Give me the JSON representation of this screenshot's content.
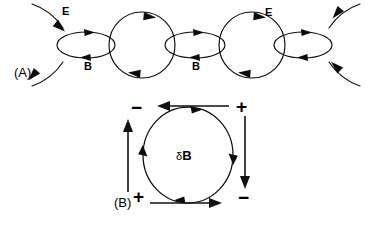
{
  "figure": {
    "width": 371,
    "height": 225,
    "background": "#ffffff",
    "ink_color": "#0d0d0d"
  },
  "panel_a": {
    "label": "(A)",
    "label_x": 14,
    "label_y": 66,
    "description": "Chain of alternating electric field loops and magnetic field loops of an electromagnetic wave",
    "axis_y": 45,
    "e_labels": [
      {
        "text": "E",
        "x": 62,
        "y": 6
      },
      {
        "text": "E",
        "x": 265,
        "y": 7
      }
    ],
    "b_labels": [
      {
        "text": "B",
        "x": 84,
        "y": 61
      },
      {
        "text": "B",
        "x": 192,
        "y": 61
      }
    ],
    "e_circles": [
      {
        "cx": 142,
        "cy": 45,
        "r": 33,
        "direction": "clockwise"
      },
      {
        "cx": 252,
        "cy": 45,
        "r": 33,
        "direction": "clockwise"
      }
    ],
    "b_ellipses": [
      {
        "cx": 86,
        "cy": 45,
        "rx": 29,
        "ry": 13,
        "direction": "clockwise"
      },
      {
        "cx": 195,
        "cy": 45,
        "rx": 30,
        "ry": 13,
        "direction": "clockwise"
      },
      {
        "cx": 303,
        "cy": 45,
        "rx": 29,
        "ry": 13,
        "direction": "clockwise"
      }
    ],
    "edge_arcs": [
      {
        "side": "left",
        "position": "upper"
      },
      {
        "side": "left",
        "position": "lower"
      },
      {
        "side": "right",
        "position": "upper"
      },
      {
        "side": "right",
        "position": "lower"
      }
    ]
  },
  "panel_b": {
    "label": "(B)",
    "label_x": 114,
    "label_y": 196,
    "description": "Induced magnetic field loop with surrounding electromotive force arrows and induced charges",
    "field_label": {
      "delta": "δ",
      "symbol": "B",
      "x": 176,
      "y": 149
    },
    "loop": {
      "cx": 188,
      "cy": 155,
      "rx": 45,
      "ry": 48,
      "direction": "clockwise"
    },
    "signs": [
      {
        "text": "−",
        "corner": "top-left",
        "x": 131,
        "y": 98
      },
      {
        "text": "+",
        "corner": "top-right",
        "x": 236,
        "y": 97
      },
      {
        "text": "+",
        "corner": "bottom-left",
        "x": 133,
        "y": 187
      },
      {
        "text": "−",
        "corner": "bottom-right",
        "x": 238,
        "y": 188
      }
    ],
    "emf_arrows": [
      {
        "side": "top",
        "direction": "left"
      },
      {
        "side": "right",
        "direction": "down"
      },
      {
        "side": "bottom",
        "direction": "right"
      },
      {
        "side": "left",
        "direction": "up"
      }
    ]
  }
}
